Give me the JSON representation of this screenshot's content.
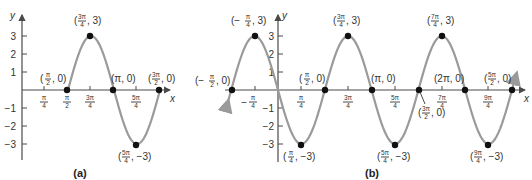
{
  "colors": {
    "curve": "#9a9a9a",
    "axis": "#4a4a4a",
    "point": "#111111"
  },
  "chart_data": [
    {
      "type": "line",
      "panel_label": "(a)",
      "function_hint": "y = 3 sin(2x − π)",
      "xlabel": "x",
      "ylabel": "y",
      "x_ticks": [
        "π/4",
        "π/2",
        "3π/4",
        "5π/4"
      ],
      "y_ticks": [
        3,
        2,
        1,
        -1,
        -2,
        -3
      ],
      "ylim": [
        -3.5,
        3.5
      ],
      "points": [
        {
          "label": "(π/2, 0)",
          "x": 1.5708,
          "y": 0
        },
        {
          "label": "(3π/4, 3)",
          "x": 2.3562,
          "y": 3
        },
        {
          "label": "(π, 0)",
          "x": 3.1416,
          "y": 0
        },
        {
          "label": "(5π/4, −3)",
          "x": 3.927,
          "y": -3
        },
        {
          "label": "(3π/2, 0)",
          "x": 4.7124,
          "y": 0
        }
      ],
      "domain": [
        1.5708,
        4.7124
      ],
      "grid": false
    },
    {
      "type": "line",
      "panel_label": "(b)",
      "function_hint": "y = 3 sin(2x − π), extended",
      "xlabel": "x",
      "ylabel": "y",
      "x_ticks": [
        "−π/4",
        "π/4",
        "3π/4",
        "5π/4",
        "7π/4",
        "9π/4"
      ],
      "y_ticks": [
        3,
        2,
        1,
        -1,
        -2,
        -3
      ],
      "ylim": [
        -3.5,
        3.5
      ],
      "points": [
        {
          "label": "(−π/2, 0)",
          "x": -1.5708,
          "y": 0
        },
        {
          "label": "(−π/4, 3)",
          "x": -0.7854,
          "y": 3
        },
        {
          "label": "(π/4, −3)",
          "x": 0.7854,
          "y": -3
        },
        {
          "label": "(π/2, 0)",
          "x": 1.5708,
          "y": 0
        },
        {
          "label": "(3π/4, 3)",
          "x": 2.3562,
          "y": 3
        },
        {
          "label": "(π, 0)",
          "x": 3.1416,
          "y": 0
        },
        {
          "label": "(5π/4, −3)",
          "x": 3.927,
          "y": -3
        },
        {
          "label": "(3π/2, 0)",
          "x": 4.7124,
          "y": 0
        },
        {
          "label": "(7π/4, 3)",
          "x": 5.4978,
          "y": 3
        },
        {
          "label": "(2π, 0)",
          "x": 6.2832,
          "y": 0
        },
        {
          "label": "(9π/4, −3)",
          "x": 7.0686,
          "y": -3
        },
        {
          "label": "(5π/2, 0)",
          "x": 7.854,
          "y": 0
        }
      ],
      "arrows_both_ends": true,
      "grid": false
    }
  ],
  "labels": {
    "a": {
      "caption": "(a)",
      "y_axis": "y",
      "x_axis": "x",
      "y_ticks": [
        "3",
        "2",
        "1",
        "−1",
        "−2",
        "−3"
      ]
    },
    "b": {
      "caption": "(b)",
      "y_axis": "y",
      "x_axis": "x",
      "y_ticks": [
        "3",
        "2",
        "1",
        "−1",
        "−2",
        "−3"
      ]
    }
  }
}
